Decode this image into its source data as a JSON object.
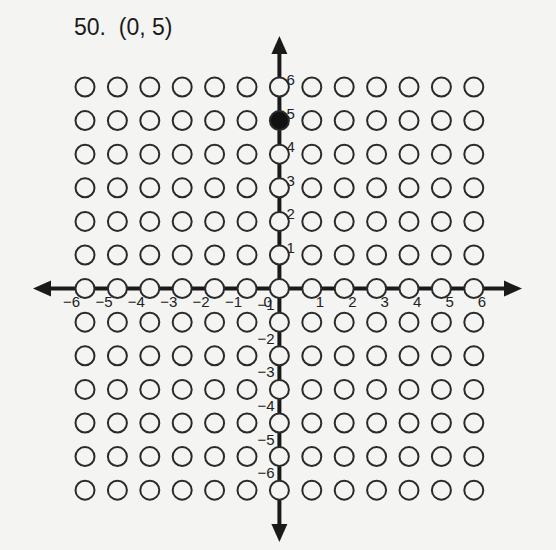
{
  "problem": {
    "number": "50.",
    "answer": "(0, 5)",
    "label": "50.  (0, 5)"
  },
  "graph": {
    "x_range": [
      -6,
      6
    ],
    "y_range": [
      -6,
      6
    ],
    "x_tick_labels": [
      "−6",
      "−5",
      "−4",
      "−3",
      "−2",
      "−1",
      "0",
      "1",
      "2",
      "3",
      "4",
      "5",
      "6"
    ],
    "y_tick_labels_positive": [
      "1",
      "2",
      "3",
      "4",
      "5",
      "6"
    ],
    "y_tick_labels_negative": [
      "−1",
      "−2",
      "−3",
      "−4",
      "−5",
      "−6"
    ],
    "plotted_point": {
      "x": 0,
      "y": 5
    },
    "colors": {
      "axis": "#1a1a1a",
      "circle_stroke": "#2a2a2a",
      "filled": "#111111",
      "empty": "#f4f4f2"
    }
  }
}
